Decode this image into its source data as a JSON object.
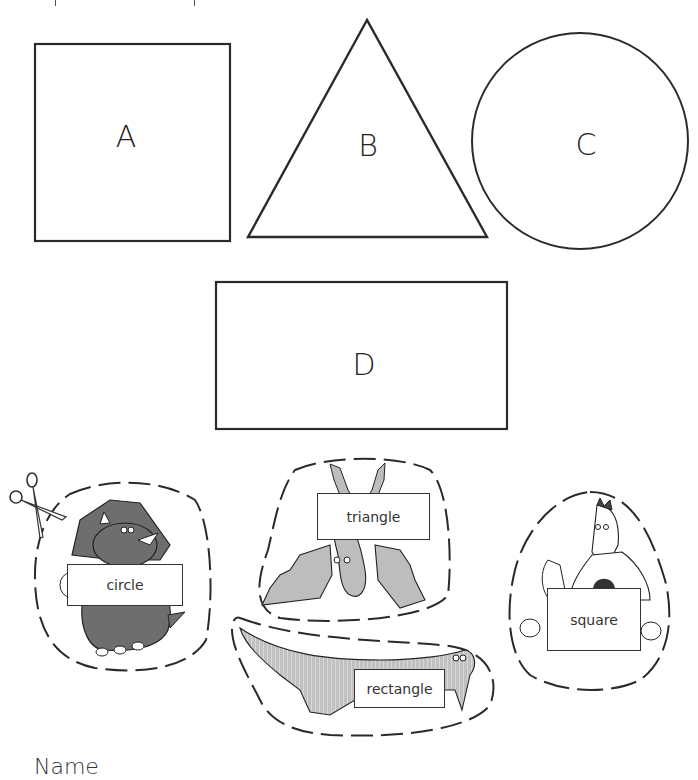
{
  "worksheet": {
    "shapes": [
      {
        "id": "A",
        "type": "square",
        "label": "A"
      },
      {
        "id": "B",
        "type": "triangle",
        "label": "B"
      },
      {
        "id": "C",
        "type": "circle",
        "label": "C"
      },
      {
        "id": "D",
        "type": "rectangle",
        "label": "D"
      }
    ],
    "cutouts": [
      {
        "word": "circle",
        "creature": "triceratops"
      },
      {
        "word": "triangle",
        "creature": "pterodactyl"
      },
      {
        "word": "rectangle",
        "creature": "crocodile"
      },
      {
        "word": "square",
        "creature": "dragon"
      }
    ],
    "scissors_icon": "scissors-icon",
    "name_label": "Name",
    "colors": {
      "outline": "#2a2a2a",
      "dino_dark": "#6e6e6e",
      "dino_light": "#bdbdbd",
      "background": "#ffffff"
    }
  }
}
